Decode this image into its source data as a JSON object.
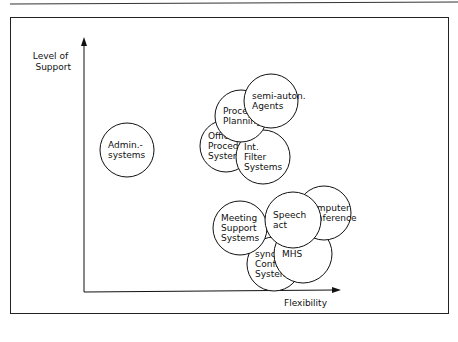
{
  "diagram": {
    "y_axis_label": [
      "Level of",
      "Support"
    ],
    "x_axis_label": "Flexibility",
    "nodes": [
      {
        "id": "admin-systems",
        "lines": [
          "Admin.-",
          "systems"
        ],
        "cx": 127,
        "cy": 150,
        "r": 27
      },
      {
        "id": "office-procedure-systems",
        "lines": [
          "Office",
          "Procedure",
          "Systems"
        ],
        "cx": 226,
        "cy": 146,
        "r": 26
      },
      {
        "id": "int-filter-systems",
        "lines": [
          "Int.",
          "Filter",
          "Systems"
        ],
        "cx": 263,
        "cy": 157,
        "r": 27
      },
      {
        "id": "procedure-planning",
        "lines": [
          "Procedure",
          "Planning"
        ],
        "cx": 241,
        "cy": 116,
        "r": 26
      },
      {
        "id": "semi-auton-agents",
        "lines": [
          "semi-auton.",
          "Agents"
        ],
        "cx": 271,
        "cy": 101,
        "r": 27
      },
      {
        "id": "synch-conf-systems",
        "lines": [
          "synch",
          "Conf.",
          "Systems"
        ],
        "cx": 274,
        "cy": 264,
        "r": 27
      },
      {
        "id": "mhs",
        "lines": [
          "MHS"
        ],
        "cx": 303,
        "cy": 254,
        "r": 29
      },
      {
        "id": "meeting-support-systems",
        "lines": [
          "Meeting",
          "Support",
          "Systems"
        ],
        "cx": 240,
        "cy": 228,
        "r": 27
      },
      {
        "id": "computer-conference",
        "lines": [
          "Computer",
          "Conference"
        ],
        "cx": 324,
        "cy": 213,
        "r": 27
      },
      {
        "id": "speech-act",
        "lines": [
          "Speech",
          "act"
        ],
        "cx": 293,
        "cy": 220,
        "r": 28
      }
    ]
  }
}
